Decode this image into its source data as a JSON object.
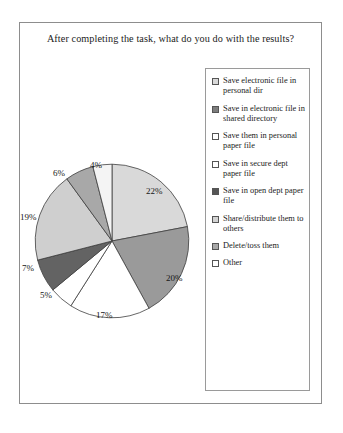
{
  "chart_data": {
    "type": "pie",
    "title": "After completing the task, what do you do with the results?",
    "xlabel": "",
    "ylabel": "",
    "legend_position": "right",
    "grid": false,
    "categories": [
      "Save electronic file in personal dir",
      "Save in electronic file in shared directory",
      "Save them in personal paper file",
      "Save in secure dept paper file",
      "Save in open dept paper file",
      "Share/distribute them to others",
      "Delete/toss them",
      "Other"
    ],
    "values": [
      22,
      20,
      17,
      5,
      7,
      19,
      6,
      4
    ],
    "value_labels": [
      "22%",
      "20%",
      "17%",
      "5%",
      "7%",
      "19%",
      "6%",
      "4%"
    ],
    "colors": [
      "#d9d9d9",
      "#9a9a9a",
      "#ffffff",
      "#ffffff",
      "#636363",
      "#cfcfcf",
      "#a8a8a8",
      "#f4f4f4"
    ]
  },
  "figure": {
    "title": "After completing the task, what do you do with the results?"
  },
  "legend": {
    "items": [
      {
        "label": "Save electronic file in personal dir",
        "swatch": "#d9d9d9",
        "pct": "22%"
      },
      {
        "label": "Save in electronic file in shared directory",
        "swatch": "#7d7d7d",
        "pct": "20%"
      },
      {
        "label": "Save them in personal paper file",
        "swatch": "#ffffff",
        "pct": "17%"
      },
      {
        "label": "Save in secure dept paper file",
        "swatch": "#ffffff",
        "pct": "5%"
      },
      {
        "label": "Save in open dept paper file",
        "swatch": "#555555",
        "pct": "7%"
      },
      {
        "label": "Share/distribute them to others",
        "swatch": "#d3d3d3",
        "pct": "19%"
      },
      {
        "label": "Delete/toss them",
        "swatch": "#a8a8a8",
        "pct": "6%"
      },
      {
        "label": "Other",
        "swatch": "#ffffff",
        "pct": "4%"
      }
    ]
  },
  "pie_labels": [
    {
      "text": "22%",
      "x": 126,
      "y": 26
    },
    {
      "text": "20%",
      "x": 146,
      "y": 113
    },
    {
      "text": "17%",
      "x": 76,
      "y": 150
    },
    {
      "text": "5%",
      "x": 20,
      "y": 130
    },
    {
      "text": "7%",
      "x": 2,
      "y": 103
    },
    {
      "text": "19%",
      "x": 0,
      "y": 52
    },
    {
      "text": "6%",
      "x": 33,
      "y": 8
    },
    {
      "text": "4%",
      "x": 70,
      "y": 0
    }
  ]
}
